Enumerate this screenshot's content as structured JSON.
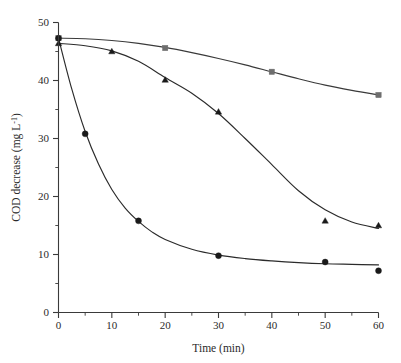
{
  "chart_data": {
    "type": "scatter",
    "title": "",
    "xlabel": "Time (min)",
    "ylabel_text": "COD decrease (mg L",
    "ylabel_sup": "-1",
    "ylabel_tail": ")",
    "ylabel_full": "COD decrease (mg L-1)",
    "xlim": [
      0,
      60
    ],
    "ylim": [
      0,
      50
    ],
    "x_ticks": [
      0,
      10,
      20,
      30,
      40,
      50,
      60
    ],
    "x_tick_labels": [
      "0",
      "10",
      "20",
      "30",
      "40",
      "50",
      "60"
    ],
    "x_minor_step": 5,
    "y_ticks": [
      0,
      10,
      20,
      30,
      40,
      50
    ],
    "y_tick_labels": [
      "0",
      "10",
      "20",
      "30",
      "40",
      "50"
    ],
    "y_minor_step": 5,
    "grid": false,
    "legend": "none",
    "series": [
      {
        "name": "series-squares",
        "marker": "square",
        "color": "#6e6e6e",
        "line_color": "#3a3a3a",
        "x": [
          0,
          20,
          40,
          60
        ],
        "y": [
          47.3,
          45.6,
          41.5,
          37.5
        ],
        "curve": [
          [
            0,
            47.3
          ],
          [
            5,
            47.2
          ],
          [
            10,
            46.9
          ],
          [
            15,
            46.4
          ],
          [
            20,
            45.7
          ],
          [
            25,
            44.8
          ],
          [
            30,
            43.8
          ],
          [
            35,
            42.7
          ],
          [
            40,
            41.5
          ],
          [
            45,
            40.3
          ],
          [
            50,
            39.2
          ],
          [
            55,
            38.3
          ],
          [
            60,
            37.5
          ]
        ]
      },
      {
        "name": "series-triangles",
        "marker": "triangle",
        "color": "#1a1a1a",
        "line_color": "#2b2b2b",
        "x": [
          0,
          10,
          20,
          30,
          50,
          60
        ],
        "y": [
          46.4,
          45.0,
          40.1,
          34.6,
          15.8,
          15.0
        ],
        "curve": [
          [
            0,
            46.4
          ],
          [
            5,
            46.0
          ],
          [
            10,
            45.1
          ],
          [
            15,
            43.3
          ],
          [
            20,
            40.5
          ],
          [
            25,
            37.8
          ],
          [
            30,
            34.3
          ],
          [
            35,
            30.0
          ],
          [
            40,
            25.5
          ],
          [
            45,
            21.0
          ],
          [
            50,
            17.7
          ],
          [
            55,
            15.6
          ],
          [
            60,
            14.5
          ]
        ]
      },
      {
        "name": "series-circles",
        "marker": "circle",
        "color": "#1a1a1a",
        "line_color": "#2b2b2b",
        "x": [
          0,
          5,
          15,
          30,
          50,
          60
        ],
        "y": [
          47.3,
          30.8,
          15.8,
          9.8,
          8.7,
          7.2
        ],
        "curve": [
          [
            0,
            47.3
          ],
          [
            2.5,
            38.5
          ],
          [
            5,
            31.2
          ],
          [
            7.5,
            25.6
          ],
          [
            10,
            21.2
          ],
          [
            12.5,
            18.0
          ],
          [
            15,
            15.7
          ],
          [
            17.5,
            13.9
          ],
          [
            20,
            12.6
          ],
          [
            25,
            10.9
          ],
          [
            30,
            9.9
          ],
          [
            35,
            9.3
          ],
          [
            40,
            8.9
          ],
          [
            45,
            8.6
          ],
          [
            50,
            8.4
          ],
          [
            55,
            8.3
          ],
          [
            60,
            8.2
          ]
        ]
      }
    ]
  },
  "axes": {
    "x_axis_name": "x-axis",
    "y_axis_name": "y-axis"
  }
}
